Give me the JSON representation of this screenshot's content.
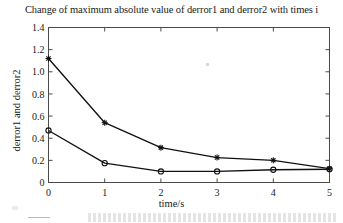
{
  "chart_data": {
    "type": "line",
    "title": "Change of maximum absolute value of derror1 and derror2 with times i",
    "xlabel": "time/s",
    "ylabel": "derror1 and derror2",
    "x": [
      0,
      1,
      2,
      3,
      4,
      5
    ],
    "xticklabels": [
      "0",
      "1",
      "2",
      "3",
      "4",
      "5"
    ],
    "yticklabels": [
      "0",
      "0.2",
      "0.4",
      "0.6",
      "0.8",
      "1.0",
      "1.2",
      "1.4"
    ],
    "ytickvalues": [
      0,
      0.2,
      0.4,
      0.6,
      0.8,
      1.0,
      1.2,
      1.4
    ],
    "xlim": [
      0,
      5
    ],
    "ylim": [
      0,
      1.4
    ],
    "grid": false,
    "legend": "none",
    "box": true,
    "series": [
      {
        "name": "derror1",
        "marker": "star",
        "color": "#111111",
        "values": [
          1.12,
          0.54,
          0.315,
          0.225,
          0.2,
          0.125
        ]
      },
      {
        "name": "derror2",
        "marker": "circle",
        "color": "#111111",
        "values": [
          0.47,
          0.175,
          0.1,
          0.1,
          0.115,
          0.12
        ]
      }
    ]
  },
  "figure": {
    "background_color": "#ffffff",
    "axis_color": "#4a4a4a",
    "line_color": "#111111"
  }
}
